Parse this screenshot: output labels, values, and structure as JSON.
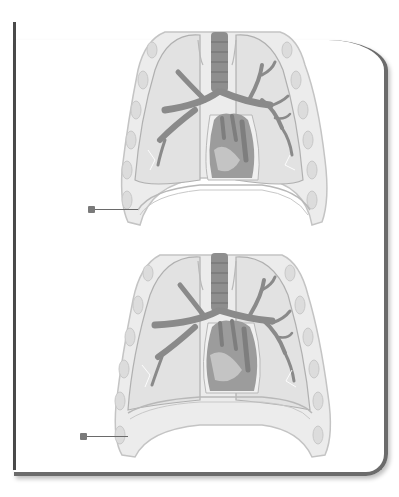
{
  "diagram": {
    "type": "anatomical illustration",
    "figures": [
      {
        "name": "thorax-exhalation",
        "description": "Frontal section of thorax showing lungs, trachea, bronchial tree, heart and domed diaphragm",
        "label_pointer": {
          "target": "diaphragm",
          "text": ""
        }
      },
      {
        "name": "thorax-inhalation",
        "description": "Frontal section of thorax showing lungs, trachea, bronchial tree, heart and flattened diaphragm",
        "label_pointer": {
          "target": "diaphragm",
          "text": ""
        }
      }
    ],
    "colors": {
      "airway": "#8a8a8a",
      "lung_fill": "#e6e6e6",
      "outline": "#b5b5b5",
      "heart": "#9a9a9a",
      "frame": "#4a4a4a"
    }
  }
}
